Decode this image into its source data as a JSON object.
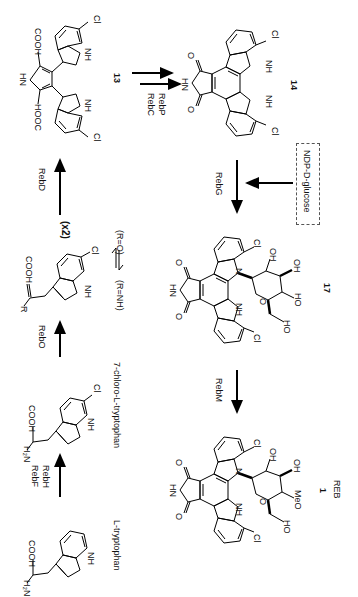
{
  "diagram": {
    "orientation": "rotated 90deg clockwise",
    "compounds": [
      {
        "id": "l-trp",
        "label": "L-tryptophan",
        "groups": [
          "H2N",
          "COOH",
          "NH"
        ]
      },
      {
        "id": "cl-trp",
        "label": "7-chloro-L-tryptophan",
        "groups": [
          "H2N",
          "COOH",
          "NH",
          "Cl"
        ]
      },
      {
        "id": "imine",
        "label": "",
        "groups": [
          "R",
          "COOH",
          "NH",
          "Cl"
        ],
        "note": "(R=NH) ⇌ (R=O)"
      },
      {
        "id": "c13",
        "label": "13",
        "groups": [
          "HN",
          "COOH",
          "HOOC",
          "NH",
          "NH",
          "Cl",
          "Cl"
        ]
      },
      {
        "id": "c14",
        "label": "14",
        "groups": [
          "HN",
          "O",
          "O",
          "NH",
          "NH",
          "Cl",
          "Cl"
        ]
      },
      {
        "id": "c17",
        "label": "17",
        "groups": [
          "HN",
          "O",
          "O",
          "N",
          "NH",
          "Cl",
          "Cl",
          "OH",
          "OH",
          "HO",
          "HO",
          "O"
        ]
      },
      {
        "id": "reb",
        "label": "1",
        "sublabel": "REB",
        "groups": [
          "HN",
          "O",
          "O",
          "N",
          "NH",
          "Cl",
          "Cl",
          "OH",
          "OH",
          "MeO",
          "HO",
          "O"
        ]
      }
    ],
    "enzymes": {
      "rebF": "RebF",
      "rebH": "RebH",
      "rebO": "RebO",
      "rebD": "RebD",
      "rebC": "RebC",
      "rebP": "RebP",
      "rebG": "RebG",
      "rebM": "RebM"
    },
    "multiplier": "(x2)",
    "equilibrium": {
      "left": "(R=NH)",
      "right": "(R=O)"
    },
    "cosubstrate": "NDP-D-glucose",
    "labels": {
      "ltrp": "L-tryptophan",
      "cltrp": "7-chloro-L-tryptophan",
      "c13": "13",
      "c14": "14",
      "c17": "17",
      "c1": "1",
      "reb": "REB",
      "h2n": "H₂N",
      "cooh": "COOH",
      "hooc": "HOOC",
      "nh": "NH",
      "hn": "HN",
      "n": "N",
      "cl": "Cl",
      "o": "O",
      "oh": "OH",
      "ho": "HO",
      "meo": "MeO",
      "r": "R"
    }
  }
}
